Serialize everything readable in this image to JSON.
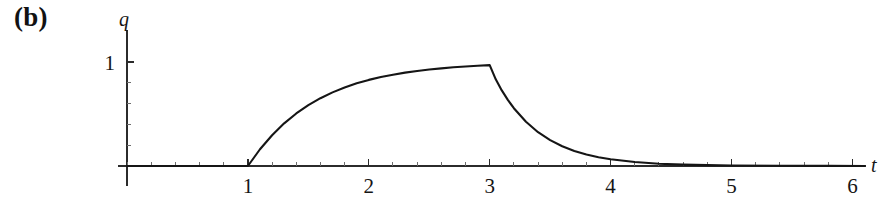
{
  "figure": {
    "panel_label": "(b)",
    "background_color": "#ffffff",
    "curve_color": "#151515",
    "axis_color": "#2b2b2b"
  },
  "chart_data": {
    "type": "line",
    "title": "",
    "subtitle": "",
    "xlabel": "t",
    "ylabel": "q",
    "xlim": [
      0,
      6.15
    ],
    "ylim": [
      0,
      1.12
    ],
    "grid": false,
    "legend": null,
    "x_ticks_major": [
      1,
      2,
      3,
      4,
      5,
      6
    ],
    "x_tick_labels": [
      "1",
      "2",
      "3",
      "4",
      "5",
      "6"
    ],
    "x_minor_per_major": 5,
    "y_ticks_major": [
      1
    ],
    "y_tick_labels": [
      "1"
    ],
    "y_minor_per_major": 5,
    "annotations": [
      {
        "text": "(b)",
        "role": "panel-label"
      }
    ],
    "series": [
      {
        "name": "q",
        "description": "Charge on capacitor: zero until t=1, exponential charging to q=1 over 1<=t<=3, exponential discharge for t>3",
        "points": [
          [
            0.0,
            0.0
          ],
          [
            0.2,
            0.0
          ],
          [
            0.4,
            0.0
          ],
          [
            0.6,
            0.0
          ],
          [
            0.8,
            0.0
          ],
          [
            1.0,
            0.0
          ],
          [
            1.1,
            0.161
          ],
          [
            1.2,
            0.296
          ],
          [
            1.3,
            0.41
          ],
          [
            1.4,
            0.505
          ],
          [
            1.5,
            0.585
          ],
          [
            1.6,
            0.652
          ],
          [
            1.7,
            0.708
          ],
          [
            1.8,
            0.755
          ],
          [
            1.9,
            0.795
          ],
          [
            2.0,
            0.828
          ],
          [
            2.1,
            0.855
          ],
          [
            2.2,
            0.878
          ],
          [
            2.3,
            0.898
          ],
          [
            2.4,
            0.914
          ],
          [
            2.5,
            0.928
          ],
          [
            2.6,
            0.939
          ],
          [
            2.7,
            0.949
          ],
          [
            2.8,
            0.957
          ],
          [
            2.9,
            0.964
          ],
          [
            3.0,
            0.97
          ],
          [
            3.05,
            0.833
          ],
          [
            3.1,
            0.727
          ],
          [
            3.15,
            0.636
          ],
          [
            3.2,
            0.556
          ],
          [
            3.3,
            0.425
          ],
          [
            3.4,
            0.325
          ],
          [
            3.5,
            0.249
          ],
          [
            3.6,
            0.19
          ],
          [
            3.7,
            0.145
          ],
          [
            3.8,
            0.111
          ],
          [
            3.9,
            0.085
          ],
          [
            4.0,
            0.065
          ],
          [
            4.2,
            0.038
          ],
          [
            4.4,
            0.022
          ],
          [
            4.6,
            0.013
          ],
          [
            4.8,
            0.008
          ],
          [
            5.0,
            0.005
          ],
          [
            5.4,
            0.002
          ],
          [
            5.8,
            0.001
          ],
          [
            6.1,
            0.0
          ]
        ]
      }
    ]
  }
}
